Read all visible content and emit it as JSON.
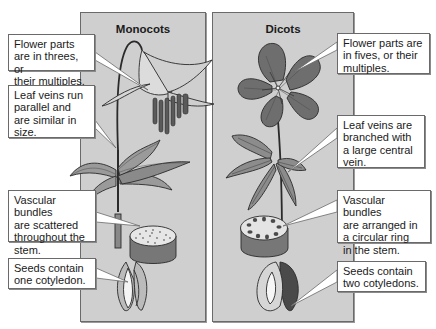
{
  "panels": {
    "monocots": {
      "title": "Monocots",
      "callouts": {
        "flower": "Flower parts\nare in threes, or\ntheir multiples.",
        "leaf": "Leaf veins run\nparallel and\nare similar in\nsize.",
        "vascular": "Vascular bundles\nare scattered\nthroughout the\nstem.",
        "seed": "Seeds contain\none cotyledon."
      }
    },
    "dicots": {
      "title": "Dicots",
      "callouts": {
        "flower": "Flower parts are\nin fives, or their\nmultiples.",
        "leaf": "Leaf veins are\nbranched with\na large central\nvein.",
        "vascular": "Vascular bundles\nare arranged in\na circular ring\nin the stem.",
        "seed": "Seeds contain\ntwo cotyledons."
      }
    }
  },
  "colors": {
    "panel_bg": "#cfcfcf",
    "panel_border": "#6a6a6a",
    "callout_bg": "#ffffff",
    "dicot_flower": "#6e6e6e",
    "leaf": "#8a8a8a"
  }
}
